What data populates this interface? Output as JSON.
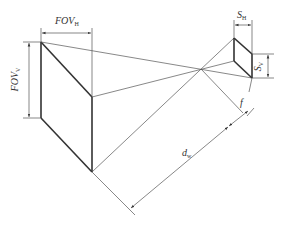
{
  "diagram": {
    "labels": {
      "fov_h": {
        "main": "FOV",
        "sub": "H"
      },
      "fov_v": {
        "main": "FOV",
        "sub": "V"
      },
      "s_h": {
        "main": "S",
        "sub": "H"
      },
      "s_v": {
        "main": "S",
        "sub": "V"
      },
      "f": {
        "main": "f"
      },
      "d_w": {
        "main": "d",
        "sub": "w"
      }
    },
    "colors": {
      "line": "#333333",
      "thin": "#555555",
      "background": "#ffffff"
    }
  }
}
